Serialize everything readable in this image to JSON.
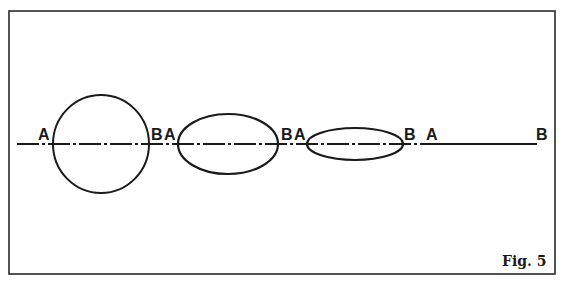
{
  "figure": {
    "caption": "Fig. 5",
    "frame": {
      "x": 9,
      "y": 11,
      "width": 546,
      "height": 263,
      "color": "#2a2a2a"
    },
    "axis": {
      "y": 144,
      "x_start": 17,
      "x_end": 537,
      "dashed_until": 440,
      "color": "#1a1a1a"
    },
    "shapes": [
      {
        "type": "circle",
        "cx": 101,
        "cy": 144,
        "rx": 48,
        "ry": 49,
        "label_a": "A",
        "label_b": "B"
      },
      {
        "type": "ellipse",
        "cx": 228,
        "cy": 144,
        "rx": 50,
        "ry": 30,
        "label_a": "A",
        "label_b": "B"
      },
      {
        "type": "ellipse",
        "cx": 355,
        "cy": 144,
        "rx": 48,
        "ry": 16,
        "label_a": "A",
        "label_b": "B"
      },
      {
        "type": "line",
        "label_a": "A",
        "label_b": "B"
      }
    ],
    "labels": [
      {
        "text": "A",
        "x": 38,
        "y": 140
      },
      {
        "text": "B",
        "x": 151,
        "y": 140
      },
      {
        "text": "A",
        "x": 164,
        "y": 140
      },
      {
        "text": "B",
        "x": 281,
        "y": 140
      },
      {
        "text": "A",
        "x": 294,
        "y": 140
      },
      {
        "text": "B",
        "x": 404,
        "y": 140
      },
      {
        "text": "A",
        "x": 426,
        "y": 140
      },
      {
        "text": "B",
        "x": 536,
        "y": 140
      }
    ]
  }
}
